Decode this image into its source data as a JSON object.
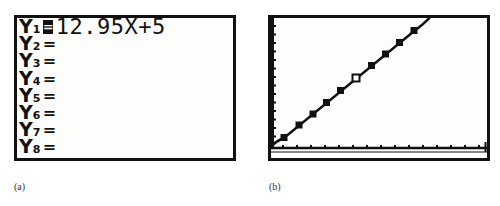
{
  "panel_a": {
    "caption": "(a)",
    "functions": [
      {
        "name": "Y",
        "index": "1",
        "equals": "=",
        "expression": "12.95X+5",
        "selected": true
      },
      {
        "name": "Y",
        "index": "2",
        "equals": "=",
        "expression": "",
        "selected": false
      },
      {
        "name": "Y",
        "index": "3",
        "equals": "=",
        "expression": "",
        "selected": false
      },
      {
        "name": "Y",
        "index": "4",
        "equals": "=",
        "expression": "",
        "selected": false
      },
      {
        "name": "Y",
        "index": "5",
        "equals": "=",
        "expression": "",
        "selected": false
      },
      {
        "name": "Y",
        "index": "6",
        "equals": "=",
        "expression": "",
        "selected": false
      },
      {
        "name": "Y",
        "index": "7",
        "equals": "=",
        "expression": "",
        "selected": false
      },
      {
        "name": "Y",
        "index": "8",
        "equals": "=",
        "expression": "",
        "selected": false
      }
    ]
  },
  "panel_b": {
    "caption": "(b)",
    "graph": {
      "function": "Y1=12.95X+5",
      "x_ticks": 15,
      "y_ticks": 15,
      "points_count": 10,
      "highlighted_point_index": 5
    }
  },
  "colors": {
    "ink": "#111111",
    "screen": "#fdfdfb",
    "caption": "#333333"
  }
}
